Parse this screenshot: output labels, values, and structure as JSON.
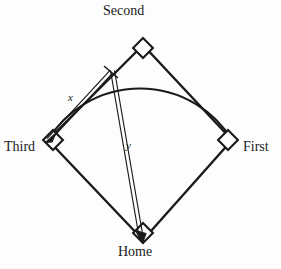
{
  "figure": {
    "background_color": "#fdfdfd",
    "ink_color": "#1a1a1a"
  },
  "bases": [
    {
      "key": "second",
      "label": "Second",
      "x": 143,
      "y": 45
    },
    {
      "key": "first",
      "label": "First",
      "x": 232,
      "y": 140
    },
    {
      "key": "home",
      "label": "Home",
      "x": 143,
      "y": 240
    },
    {
      "key": "third",
      "label": "Third",
      "x": 48,
      "y": 140
    }
  ],
  "measures": [
    {
      "key": "x",
      "label": "x",
      "from_x": 110,
      "from_y": 72,
      "to_x": 48,
      "to_y": 140
    },
    {
      "key": "y",
      "label": "y",
      "from_x": 110,
      "from_y": 72,
      "to_x": 143,
      "to_y": 240
    }
  ],
  "arc": {
    "start_x": 48,
    "start_y": 140,
    "end_x": 232,
    "end_y": 140,
    "peak_x": 143,
    "peak_y": 30
  },
  "icons": {
    "base_marker": "diamond-base-icon",
    "arrow_head": "arrowhead-icon"
  }
}
